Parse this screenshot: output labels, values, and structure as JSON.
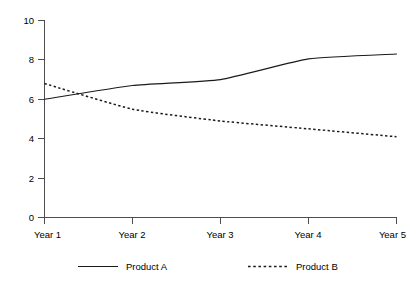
{
  "chart_data": {
    "type": "line",
    "title": "",
    "xlabel": "",
    "ylabel": "",
    "categories": [
      "Year 1",
      "Year 2",
      "Year 3",
      "Year 4",
      "Year 5"
    ],
    "series": [
      {
        "name": "Product A",
        "style": "solid",
        "color": "#1a1a1a",
        "values": [
          6.0,
          6.7,
          7.0,
          8.05,
          8.3
        ]
      },
      {
        "name": "Product B",
        "style": "dashed",
        "color": "#1a1a1a",
        "values": [
          6.8,
          5.5,
          4.9,
          4.5,
          4.1
        ]
      }
    ],
    "ylim": [
      0,
      10
    ],
    "y_ticks": [
      "0",
      "2",
      "4",
      "6",
      "8",
      "10"
    ],
    "y_tick_values": [
      0,
      2,
      4,
      6,
      8,
      10
    ],
    "x_ticks": [
      "Year 1",
      "Year 2",
      "Year 3",
      "Year 4",
      "Year 5"
    ],
    "grid": false,
    "legend_position": "bottom",
    "smoothing": "spline",
    "background": "#ffffff",
    "axis_color": "#4d4d4d"
  },
  "axes": {
    "y": {
      "labels": [
        {
          "text": "10",
          "value": 10
        },
        {
          "text": "8",
          "value": 8
        },
        {
          "text": "6",
          "value": 6
        },
        {
          "text": "4",
          "value": 4
        },
        {
          "text": "2",
          "value": 2
        },
        {
          "text": "0",
          "value": 0
        }
      ]
    },
    "x": {
      "labels": [
        {
          "text": "Year 1",
          "index": 0
        },
        {
          "text": "Year 2",
          "index": 1
        },
        {
          "text": "Year 3",
          "index": 2
        },
        {
          "text": "Year 4",
          "index": 3
        },
        {
          "text": "Year 5",
          "index": 4
        }
      ]
    }
  },
  "legend": {
    "entries": [
      {
        "label": "Product A",
        "style": "solid"
      },
      {
        "label": "Product B",
        "style": "dashed"
      }
    ]
  }
}
